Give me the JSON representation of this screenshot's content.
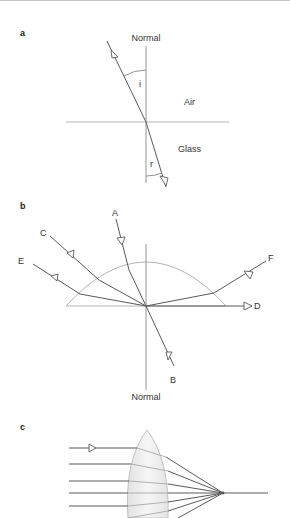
{
  "figure": {
    "panels": [
      {
        "id": "a",
        "label": "a",
        "normal_label": "Normal",
        "medium_top": "Air",
        "medium_bottom": "Glass",
        "angle_incidence": "i",
        "angle_refraction": "r"
      },
      {
        "id": "b",
        "label": "b",
        "normal_label": "Normal",
        "rays": [
          "A",
          "B",
          "C",
          "D",
          "E",
          "F"
        ]
      },
      {
        "id": "c",
        "label": "c",
        "description": "Parallel rays converging through a convex lens to a focal point"
      }
    ]
  },
  "colors": {
    "ray": "#5a5a5a",
    "surface": "#b5b5b5",
    "lens_fill": "#eeeeee",
    "text": "#333333"
  }
}
